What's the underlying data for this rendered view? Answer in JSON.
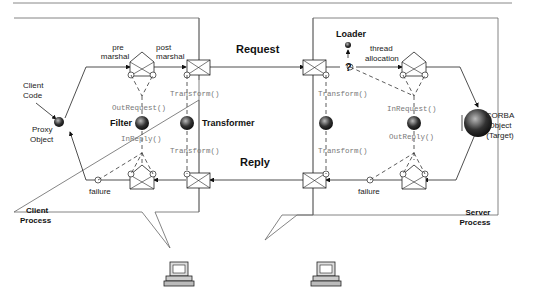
{
  "diagram": {
    "flows": {
      "request": "Request",
      "reply": "Reply"
    },
    "client": {
      "process_label_1": "Client",
      "process_label_2": "Process",
      "client_code_1": "Client",
      "client_code_2": "Code",
      "proxy_1": "Proxy",
      "proxy_2": "Object",
      "pre_1": "pre",
      "pre_2": "marshal",
      "post_1": "post",
      "post_2": "marshal",
      "filter": "Filter",
      "transformer": "Transformer",
      "out_request": "OutRequest()",
      "in_reply": "InReply()",
      "transform_top": "Transform()",
      "transform_bottom": "Transform()",
      "failure": "failure"
    },
    "server": {
      "process_label_1": "Server",
      "process_label_2": "Process",
      "loader": "Loader",
      "question": "?",
      "thread_1": "thread",
      "thread_2": "allocation",
      "in_request": "InRequest()",
      "out_reply": "OutReply()",
      "transform_top": "Transform()",
      "transform_bottom": "Transform()",
      "corba_1": "CORBA",
      "corba_2": "Object",
      "corba_3": "(Target)",
      "failure": "failure"
    }
  }
}
